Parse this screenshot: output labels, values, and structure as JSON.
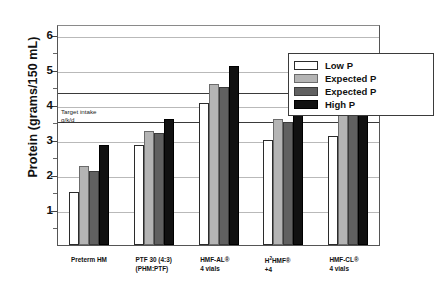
{
  "chart_data": {
    "type": "bar",
    "title": "",
    "xlabel": "",
    "ylabel": "Protein (grams/150 mL)",
    "ylim": [
      0,
      6.3
    ],
    "yticks": [
      1,
      2,
      3,
      4,
      5,
      6
    ],
    "ytick_labels": [
      "1",
      "2",
      "3",
      "4",
      "5",
      "6"
    ],
    "grid": true,
    "legend_position": "top-right",
    "categories": [
      "Preterm HM",
      "PTF 30 (4:3) (PHM:PTF)",
      "HMF-AL® 4 vials",
      "H²HMF® +4",
      "HMF-CL® 4 vials"
    ],
    "series": [
      {
        "name": "Low P",
        "color": "#ffffff",
        "values": [
          1.5,
          2.85,
          4.05,
          3.0,
          3.1
        ]
      },
      {
        "name": "Expected P",
        "color": "#b4b4b4",
        "values": [
          2.25,
          3.25,
          4.6,
          3.6,
          3.85
        ]
      },
      {
        "name": "Expected P",
        "color": "#606060",
        "values": [
          2.1,
          3.2,
          4.5,
          3.5,
          3.7
        ]
      },
      {
        "name": "High P",
        "color": "#111111",
        "values": [
          2.85,
          3.6,
          5.1,
          4.1,
          4.4
        ]
      }
    ],
    "reference_lines": [
      {
        "value": 4.4,
        "label": ""
      },
      {
        "value": 3.55,
        "label": "Target intake g/k/d"
      }
    ],
    "annotations": [
      {
        "line1": "Target intake",
        "line2": "g/k/d",
        "value": 3.9
      }
    ]
  },
  "axis": {
    "y_title": "Protein (grams/150 mL)"
  },
  "legend": {
    "entries": [
      {
        "label": "Low P"
      },
      {
        "label": "Expected P"
      },
      {
        "label": "Expected P"
      },
      {
        "label": "High P"
      }
    ]
  },
  "xlabels": [
    {
      "line1": "Preterm HM",
      "line2": ""
    },
    {
      "line1": "PTF 30 (4:3)",
      "line2": "(PHM:PTF)"
    },
    {
      "line1": "HMF-AL®",
      "line2": "4 vials"
    },
    {
      "line1": "H²HMF®",
      "line2": "+4"
    },
    {
      "line1": "HMF-CL®",
      "line2": "4 vials"
    }
  ],
  "annotation": {
    "line1": "Target intake",
    "line2": "g/k/d"
  }
}
